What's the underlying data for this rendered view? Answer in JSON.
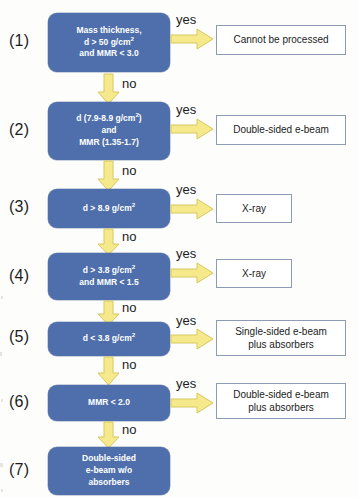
{
  "diagram": {
    "colors": {
      "decision_fill": "#4e6fab",
      "arrow_fill": "#f5e98c",
      "arrow_stroke": "#d8c85f",
      "outcome_border": "#8e9bb4",
      "background": "#fdfdfc"
    },
    "edge_labels": {
      "yes": "yes",
      "no": "no"
    },
    "steps": [
      {
        "number": "(1)",
        "decision_lines": [
          "Mass thickness,",
          "d > 50 g/cm",
          "and MMR < 3.0"
        ],
        "decision_sup": "2",
        "yes_label": "yes",
        "no_label": "no",
        "outcome_lines": [
          "Cannot be processed"
        ]
      },
      {
        "number": "(2)",
        "decision_lines": [
          "d (7.9-8.9 g/cm",
          "and",
          "MMR (1.35-1.7)"
        ],
        "decision_sup": "2",
        "yes_label": "yes",
        "no_label": "no",
        "outcome_lines": [
          "Double-sided e-beam"
        ]
      },
      {
        "number": "(3)",
        "decision_lines": [
          "d > 8.9 g/cm"
        ],
        "decision_sup": "2",
        "yes_label": "yes",
        "no_label": "no",
        "outcome_lines": [
          "X-ray"
        ]
      },
      {
        "number": "(4)",
        "decision_lines": [
          "d > 3.8 g/cm",
          "and MMR < 1.5"
        ],
        "decision_sup": "2",
        "yes_label": "yes",
        "no_label": "no",
        "outcome_lines": [
          "X-ray"
        ]
      },
      {
        "number": "(5)",
        "decision_lines": [
          "d < 3.8 g/cm"
        ],
        "decision_sup": "2",
        "yes_label": "yes",
        "no_label": "no",
        "outcome_lines": [
          "Single-sided e-beam",
          "plus absorbers"
        ]
      },
      {
        "number": "(6)",
        "decision_lines": [
          "MMR < 2.0"
        ],
        "decision_sup": "",
        "yes_label": "yes",
        "no_label": "no",
        "outcome_lines": [
          "Double-sided e-beam",
          "plus absorbers"
        ]
      },
      {
        "number": "(7)",
        "decision_lines": [
          "Double-sided",
          "e-beam w/o",
          "absorbers"
        ],
        "decision_sup": "",
        "yes_label": "",
        "no_label": "",
        "outcome_lines": []
      }
    ]
  }
}
